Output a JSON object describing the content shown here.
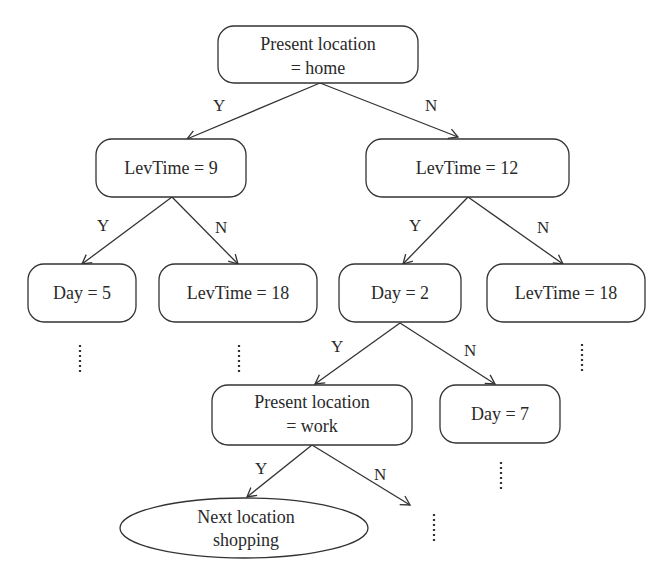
{
  "diagram": {
    "type": "decision-tree",
    "nodes": {
      "root": {
        "line1": "Present location",
        "line2": "= home"
      },
      "levtime9": {
        "label": "LevTime = 9"
      },
      "levtime12": {
        "label": "LevTime = 12"
      },
      "day5": {
        "label": "Day = 5"
      },
      "levtime18_left": {
        "label": "LevTime = 18"
      },
      "day2": {
        "label": "Day = 2"
      },
      "levtime18_right": {
        "label": "LevTime = 18"
      },
      "present_work": {
        "line1": "Present location",
        "line2": "= work"
      },
      "day7": {
        "label": "Day = 7"
      },
      "leaf_shopping": {
        "line1": "Next location",
        "line2": "shopping"
      }
    },
    "edge_labels": {
      "root_yes": "Y",
      "root_no": "N",
      "levtime9_yes": "Y",
      "levtime9_no": "N",
      "levtime12_yes": "Y",
      "levtime12_no": "N",
      "day2_yes": "Y",
      "day2_no": "N",
      "work_yes": "Y",
      "work_no": "N"
    }
  }
}
